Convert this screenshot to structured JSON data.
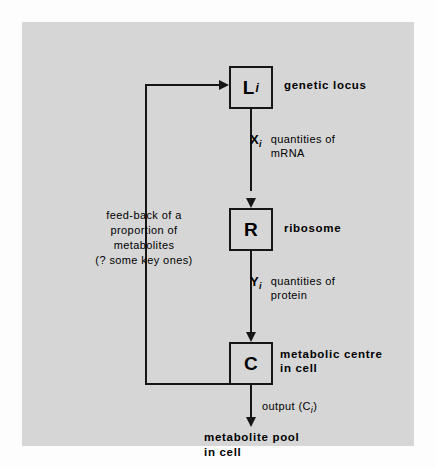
{
  "diagram": {
    "title_alt": "gene expression feedback loop diagram",
    "nodes": [
      {
        "id": "locus",
        "symbol": "L",
        "subscript": "i",
        "label": "genetic  locus"
      },
      {
        "id": "ribosome",
        "symbol": "R",
        "subscript": "",
        "label": "ribosome"
      },
      {
        "id": "centre",
        "symbol": "C",
        "subscript": "",
        "label": "metabolic  centre\nin cell"
      }
    ],
    "annotations": [
      {
        "id": "x",
        "symbol": "X",
        "subscript": "i",
        "text": "quantities of\n      mRNA"
      },
      {
        "id": "y",
        "symbol": "Y",
        "subscript": "i",
        "text": "quantities of\nprotein"
      }
    ],
    "output": {
      "prefix": "output  (C",
      "subscript": "i",
      "suffix": ")"
    },
    "pool_label": "metabolite pool\nin cell",
    "feedback_caption": "feed-back of a\nproportion of\nmetabolites\n(? some key ones)",
    "colors": {
      "panel_background": "#d6d6d6",
      "page_background": "#fdfdfd",
      "ink": "#161616"
    }
  }
}
